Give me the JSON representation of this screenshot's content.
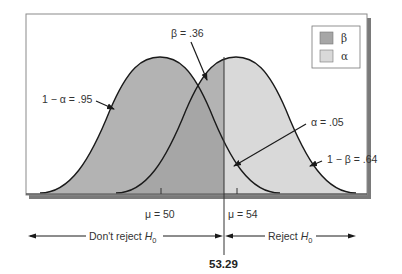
{
  "diagram": {
    "type": "hypothesis-test-error-distributions",
    "colors": {
      "beta_fill": "#b3b3b3",
      "alpha_fill": "#d9d9d9",
      "overlap_fill": "#a6a6a6",
      "curve_stroke": "#1a1a1a",
      "frame_shadow": "#7a7a7a",
      "background": "#ffffff"
    },
    "legend": {
      "items": [
        {
          "symbol": "β",
          "swatch": "beta"
        },
        {
          "symbol": "α",
          "swatch": "alpha"
        }
      ]
    },
    "annotations": {
      "one_minus_alpha": "1 − α = .95",
      "beta": "β = .36",
      "alpha": "α = .05",
      "one_minus_beta": "1 − β = .64"
    },
    "axis": {
      "mu0_label": "μ = 50",
      "mu1_label": "μ = 54",
      "critical_value": "53.29"
    },
    "regions": {
      "dont_reject_prefix": "Don't reject ",
      "reject_prefix": "Reject ",
      "hypothesis_symbol": "H",
      "hypothesis_subscript": "0"
    },
    "values": {
      "mu0": 50,
      "mu1": 54,
      "critical": 53.29,
      "alpha": 0.05,
      "one_minus_alpha": 0.95,
      "beta": 0.36,
      "one_minus_beta": 0.64
    }
  }
}
